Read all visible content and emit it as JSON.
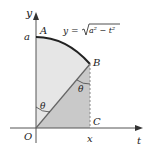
{
  "diagram": {
    "equation": "y = √(a² − t²)",
    "equation_parts": {
      "lhs": "y = ",
      "radicand": "a² − t²"
    },
    "axes": {
      "x_axis_label": "t",
      "y_axis_label": "y"
    },
    "points": {
      "A": "A",
      "B": "B",
      "C": "C",
      "O": "O"
    },
    "ticks": {
      "y_tick": "a",
      "x_tick": "x"
    },
    "angles": {
      "angle_at_O": "θ",
      "angle_at_B": "θ"
    },
    "colors": {
      "sector_fill": "#e6e6e6",
      "triangle_fill": "#c9c9c9",
      "curve": "#222222",
      "axis": "#555555",
      "segment_OB": "#666666",
      "dashed_BC": "#888888"
    }
  }
}
